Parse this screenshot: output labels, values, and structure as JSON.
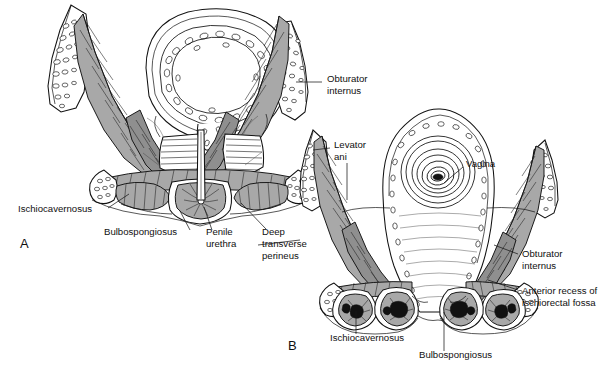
{
  "figure": {
    "background_color": "#ffffff",
    "ink_color": "#111111",
    "muscle_fill": "#a8a8a8",
    "bone_fill": "#ffffff",
    "dark_fill": "#111111",
    "width": 613,
    "height": 371
  },
  "panels": [
    {
      "id": "A",
      "letter": "A",
      "letter_pos": {
        "x": 20,
        "y": 248
      },
      "subject": "male perineum"
    },
    {
      "id": "B",
      "letter": "B",
      "letter_pos": {
        "x": 288,
        "y": 350
      },
      "subject": "female perineum"
    }
  ],
  "labels": [
    {
      "key": "a_obturator_internus",
      "panel": "A",
      "lines": [
        "Obturator",
        "internus"
      ],
      "text": "Obturator internus",
      "x": 327,
      "y": 78,
      "anchor": "start",
      "leader": "M 322 82 L 296 82"
    },
    {
      "key": "a_ischiocavernosus",
      "panel": "A",
      "lines": [
        "Ischiocavernosus"
      ],
      "text": "Ischiocavernosus",
      "x": 18,
      "y": 212,
      "anchor": "start",
      "leader": "M 108 208 L 129 194"
    },
    {
      "key": "a_bulbospongiosus",
      "panel": "A",
      "lines": [
        "Bulbospongiosus"
      ],
      "text": "Bulbospongiosus",
      "x": 104,
      "y": 235,
      "anchor": "start",
      "leader": "M 190 230 L 179 210"
    },
    {
      "key": "a_penile_urethra",
      "panel": "A",
      "lines": [
        "Penile",
        "urethra"
      ],
      "text": "Penile urethra",
      "x": 206,
      "y": 235,
      "anchor": "start",
      "leader": "M 212 230 L 204 206"
    },
    {
      "key": "a_deep_transverse_perineus",
      "panel": "A",
      "lines": [
        "Deep",
        "transverse",
        "perineus"
      ],
      "text": "Deep transverse perineus",
      "x": 262,
      "y": 235,
      "anchor": "start",
      "leader": "M 266 229 L 240 203"
    },
    {
      "key": "b_levator_ani",
      "panel": "B",
      "lines": [
        "Levator",
        "ani"
      ],
      "text": "Levator ani",
      "x": 334,
      "y": 144,
      "anchor": "start",
      "leader": "M 329 148 L 312 150"
    },
    {
      "key": "b_vagina",
      "panel": "B",
      "lines": [
        "Vagina"
      ],
      "text": "Vagina",
      "x": 466,
      "y": 163,
      "anchor": "start",
      "leader": "M 463 167 L 443 182"
    },
    {
      "key": "b_obturator_internus",
      "panel": "B",
      "lines": [
        "Obturator",
        "internus"
      ],
      "text": "Obturator internus",
      "x": 522,
      "y": 257,
      "anchor": "start",
      "leader": "M 518 257 L 494 247"
    },
    {
      "key": "b_anterior_recess",
      "panel": "B",
      "lines": [
        "Anterior recess of",
        "ischiorectal fossa"
      ],
      "text": "Anterior recess of ischiorectal fossa",
      "x": 522,
      "y": 295,
      "anchor": "start",
      "leader": "M 518 292 L 487 281"
    },
    {
      "key": "b_ischiocavernosus",
      "panel": "B",
      "lines": [
        "Ischiocavernosus"
      ],
      "text": "Ischiocavernosus",
      "x": 330,
      "y": 341,
      "anchor": "start",
      "leader": "M 355 332 L 355 308"
    },
    {
      "key": "b_bulbospongiosus",
      "panel": "B",
      "lines": [
        "Bulbospongiosus"
      ],
      "text": "Bulbospongiosus",
      "x": 419,
      "y": 358,
      "anchor": "start",
      "leader": "M 444 350 L 444 310"
    }
  ],
  "structures": {
    "panel_a": [
      "right ischiopubic ramus",
      "left ischiopubic ramus",
      "rectum / anal canal ring",
      "levator ani sheets",
      "deep transverse perineus",
      "bulbospongiosus",
      "ischiocavernosus",
      "penile urethra",
      "ischial tuberosity"
    ],
    "panel_b": [
      "right ischiopubic ramus",
      "left ischiopubic ramus",
      "vagina",
      "levator ani sheets",
      "obturator internus",
      "bulbospongiosus",
      "ischiocavernosus",
      "anterior recess of ischiorectal fossa",
      "ischial tuberosity"
    ]
  }
}
